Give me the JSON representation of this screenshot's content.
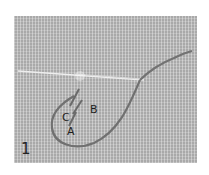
{
  "figure": {
    "number": "1",
    "labels": [
      {
        "id": "C",
        "text": "C"
      },
      {
        "id": "B",
        "text": "B"
      },
      {
        "id": "A",
        "text": "A"
      }
    ],
    "colors": {
      "canvas": "#a9a9a9",
      "thread": "#6e6e6e",
      "needle": "#e6e6e6"
    }
  }
}
